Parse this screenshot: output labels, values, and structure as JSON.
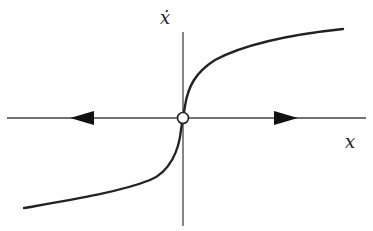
{
  "diagram": {
    "type": "phase-line",
    "labels": {
      "y_axis": "ẋ",
      "x_axis": "x"
    },
    "fixed_point": {
      "x": 0,
      "stability": "unstable",
      "marker": "open-circle"
    },
    "arrows": [
      {
        "direction": "left",
        "position": "negative x"
      },
      {
        "direction": "right",
        "position": "positive x"
      }
    ],
    "curve": "odd increasing function, vertical tangent at origin (cube-root-like)",
    "colors": {
      "line": "#222222",
      "axis": "#444444",
      "background": "#ffffff"
    }
  }
}
